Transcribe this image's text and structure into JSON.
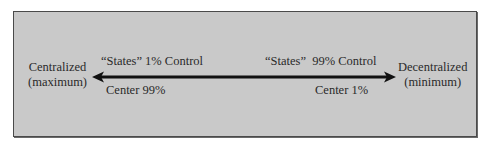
{
  "diagram": {
    "left_end": {
      "line1": "Centralized",
      "line2": "(maximum)"
    },
    "right_end": {
      "line1": "Decentralized",
      "line2": "(minimum)"
    },
    "top_left_label": "“States” 1% Control",
    "bottom_left_label": "Center 99%",
    "top_right_label": "“States”  99% Control",
    "bottom_right_label": "Center 1%",
    "arrow": {
      "type": "double-headed",
      "color": "#111111"
    },
    "colors": {
      "background": "#c9c9c9",
      "border": "#4a4a4a",
      "text": "#2a2a2a"
    }
  }
}
